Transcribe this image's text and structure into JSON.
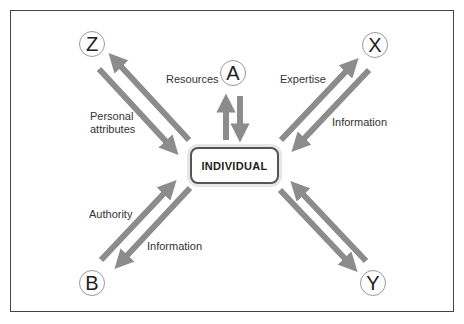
{
  "center": {
    "label": "INDIVIDUAL"
  },
  "nodes": {
    "z": "Z",
    "a": "A",
    "x": "X",
    "b": "B",
    "y": "Y"
  },
  "labels": {
    "resources": "Resources",
    "personal_line1": "Personal",
    "personal_line2": "attributes",
    "expertise": "Expertise",
    "information_x": "Information",
    "authority": "Authority",
    "information_b": "Information"
  },
  "colors": {
    "arrow": "#8c8c8c",
    "frame": "#444444",
    "node_border": "#999999"
  }
}
